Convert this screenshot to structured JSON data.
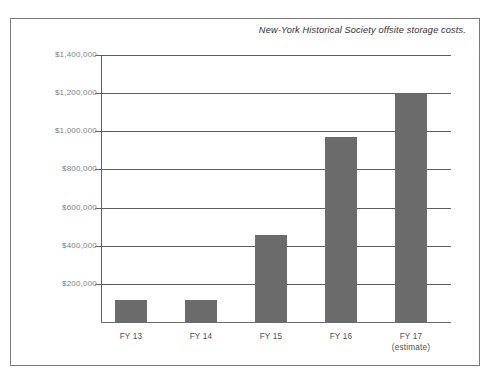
{
  "chart_data": {
    "type": "bar",
    "title": "New-York Historical Society offsite storage costs.",
    "xlabel": "",
    "ylabel": "",
    "categories": [
      "FY 13",
      "FY 14",
      "FY 15",
      "FY 16",
      "FY 17"
    ],
    "category_sublabels": [
      "",
      "",
      "",
      "",
      "(estimate)"
    ],
    "values": [
      115000,
      118000,
      455000,
      970000,
      1200000
    ],
    "ylim": [
      0,
      1400000
    ],
    "ytick_values": [
      1400000,
      1200000,
      1000000,
      800000,
      600000,
      400000,
      200000
    ],
    "ytick_labels": [
      "$1,400,000",
      "$1,200,000",
      "$1,000,000",
      "$800,000",
      "$600,000",
      "$400,000",
      "$200,000"
    ],
    "grid": true,
    "legend": null,
    "bar_color": "#6b6b6b",
    "axis_color": "#5d5f62",
    "tick_label_color": "#7d7f83",
    "frame_color": "#77797c"
  },
  "figure": {
    "title": "New-York Historical Society offsite storage costs."
  },
  "yaxis": {
    "labels": [
      {
        "text": "$1,400,000",
        "value": 1400000
      },
      {
        "text": "$1,200,000",
        "value": 1200000
      },
      {
        "text": "$1,000,000",
        "value": 1000000
      },
      {
        "text": "$800,000",
        "value": 800000
      },
      {
        "text": "$600,000",
        "value": 600000
      },
      {
        "text": "$400,000",
        "value": 400000
      },
      {
        "text": "$200,000",
        "value": 200000
      }
    ]
  },
  "xaxis": {
    "labels": [
      {
        "text": "FY 13",
        "sub": ""
      },
      {
        "text": "FY 14",
        "sub": ""
      },
      {
        "text": "FY 15",
        "sub": ""
      },
      {
        "text": "FY 16",
        "sub": ""
      },
      {
        "text": "FY 17",
        "sub": "(estimate)"
      }
    ]
  }
}
